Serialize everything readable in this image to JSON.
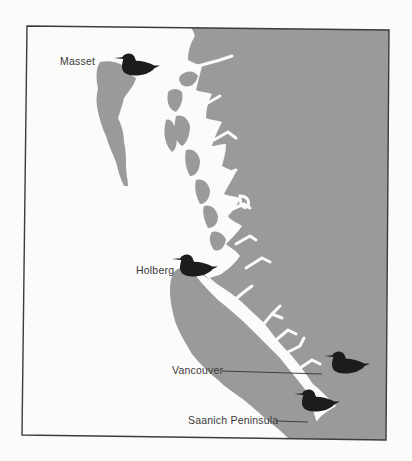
{
  "map": {
    "type": "regional coastline map",
    "region": "British Columbia coast",
    "colors": {
      "land": "#9a9a9a",
      "water": "#fbfbfa",
      "frame": "#3c3c3c",
      "bird_marker": "#1c1c1c",
      "label_text": "#3a3a3a"
    },
    "locations": [
      {
        "name": "Masset",
        "marker": "bird-icon",
        "leader_line": false
      },
      {
        "name": "Holberg",
        "marker": "bird-icon",
        "leader_line": false
      },
      {
        "name": "Vancouver",
        "marker": "bird-icon",
        "leader_line": true
      },
      {
        "name": "Saanich Peninsula",
        "marker": "bird-icon",
        "leader_line": true
      }
    ]
  }
}
